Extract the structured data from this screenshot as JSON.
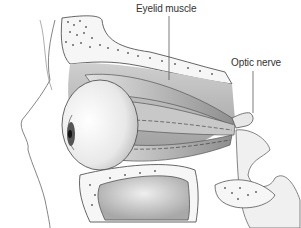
{
  "figure": {
    "type": "anatomical-illustration",
    "labels": [
      {
        "id": "eyelid",
        "text": "Eyelid muscle"
      },
      {
        "id": "optic",
        "text": "Optic nerve"
      }
    ]
  },
  "colors": {
    "background": "#ffffff",
    "line": "#555555",
    "bone_fill": "#f6f6f6",
    "shade_light": "#d8d8d8",
    "shade_mid": "#b4b4b4",
    "shade_dark": "#7a7a7a",
    "iris": "#555555",
    "label_text": "#333333"
  }
}
